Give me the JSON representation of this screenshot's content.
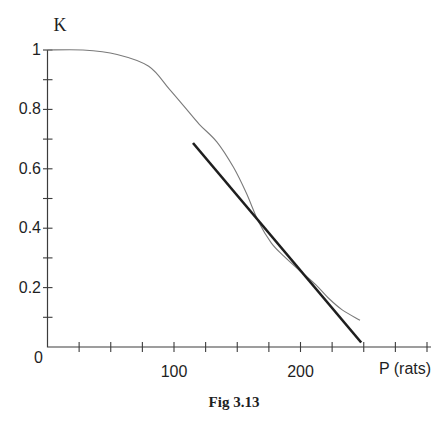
{
  "page": {
    "background": "#ffffff"
  },
  "figure": {
    "caption": "Fig 3.13"
  },
  "chart_data": {
    "type": "line",
    "title": "",
    "xlabel": "P (rats)",
    "ylabel": "K",
    "xlim": [
      0,
      300
    ],
    "ylim": [
      0,
      1
    ],
    "x_tick_step": 25,
    "y_tick_step": 0.1,
    "grid": false,
    "legend": "none",
    "axis_color": "#3c3c3c",
    "text_color": "#1f1f1f",
    "x_tick_labels": [
      {
        "value": 100,
        "label": "100"
      },
      {
        "value": 200,
        "label": "200"
      }
    ],
    "y_tick_labels": [
      {
        "value": 1,
        "label": "1"
      },
      {
        "value": 0.8,
        "label": "0.8"
      },
      {
        "value": 0.6,
        "label": "0.6"
      },
      {
        "value": 0.4,
        "label": "0.4"
      },
      {
        "value": 0.2,
        "label": "0.2"
      },
      {
        "value": 0,
        "label": "0"
      }
    ],
    "series": [
      {
        "name": "carrying-capacity-curve",
        "style": "curve",
        "color": "#7a7a7a",
        "stroke_width": 1.1,
        "points": [
          [
            0,
            1.0
          ],
          [
            28,
            1.0
          ],
          [
            55,
            0.985
          ],
          [
            80,
            0.945
          ],
          [
            96,
            0.87
          ],
          [
            108,
            0.81
          ],
          [
            120,
            0.75
          ],
          [
            134,
            0.69
          ],
          [
            147,
            0.605
          ],
          [
            157,
            0.52
          ],
          [
            167,
            0.42
          ],
          [
            177,
            0.35
          ],
          [
            187,
            0.305
          ],
          [
            200,
            0.255
          ],
          [
            212,
            0.21
          ],
          [
            222,
            0.165
          ],
          [
            233,
            0.125
          ],
          [
            247,
            0.09
          ]
        ]
      },
      {
        "name": "tangent-line",
        "style": "straight",
        "color": "#1e1e1e",
        "stroke_width": 2.6,
        "points": [
          [
            115,
            0.687
          ],
          [
            248,
            0.015
          ]
        ]
      }
    ]
  }
}
